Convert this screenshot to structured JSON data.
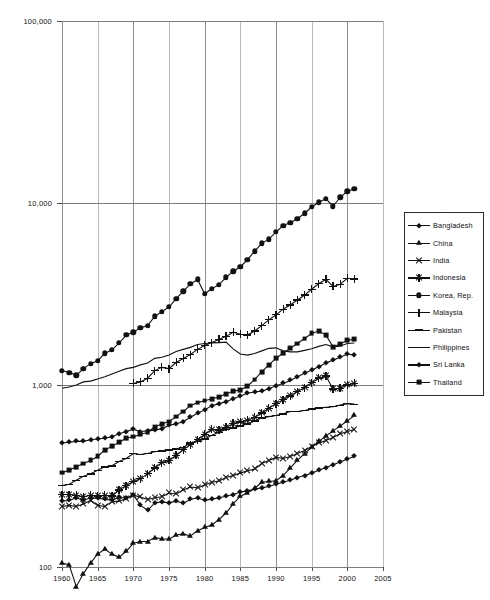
{
  "axes": {
    "ylabel": "1995 US Dollars (log scale)",
    "yticks": [
      "100,000",
      "10,000",
      "1,000",
      "100"
    ],
    "ytick_values": [
      100000,
      10000,
      1000,
      100
    ],
    "xticks": [
      "1960",
      "1965",
      "1970",
      "1975",
      "1980",
      "1985",
      "1990",
      "1995",
      "2000",
      "2005"
    ],
    "xtick_values": [
      1960,
      1965,
      1970,
      1975,
      1980,
      1985,
      1990,
      1995,
      2000,
      2005
    ]
  },
  "legend": {
    "position": "right",
    "items": [
      {
        "label": "Bangladesh",
        "marker": "diamond"
      },
      {
        "label": "China",
        "marker": "triangle"
      },
      {
        "label": "India",
        "marker": "cross"
      },
      {
        "label": "Indonesia",
        "marker": "star"
      },
      {
        "label": "Korea, Rep.",
        "marker": "circle"
      },
      {
        "label": "Malaysia",
        "marker": "plus"
      },
      {
        "label": "Pakistan",
        "marker": "dash"
      },
      {
        "label": "Philippines",
        "marker": "line"
      },
      {
        "label": "Sri Lanka",
        "marker": "diamond"
      },
      {
        "label": "Thailand",
        "marker": "square"
      }
    ]
  },
  "chart_data": {
    "type": "line",
    "title": "",
    "xlabel": "",
    "ylabel": "1995 US Dollars (log scale)",
    "yscale": "log",
    "ylim": [
      100,
      100000
    ],
    "xlim": [
      1960,
      2005
    ],
    "grid": true,
    "legend_position": "right",
    "x": [
      1960,
      1961,
      1962,
      1963,
      1964,
      1965,
      1966,
      1967,
      1968,
      1969,
      1970,
      1971,
      1972,
      1973,
      1974,
      1975,
      1976,
      1977,
      1978,
      1979,
      1980,
      1981,
      1982,
      1983,
      1984,
      1985,
      1986,
      1987,
      1988,
      1989,
      1990,
      1991,
      1992,
      1993,
      1994,
      1995,
      1996,
      1997,
      1998,
      1999,
      2000,
      2001
    ],
    "series": [
      {
        "name": "Korea, Rep.",
        "marker": "circle",
        "values": [
          1200,
          1170,
          1130,
          1230,
          1310,
          1360,
          1490,
          1560,
          1700,
          1880,
          1950,
          2060,
          2120,
          2380,
          2530,
          2680,
          2980,
          3270,
          3590,
          3800,
          3170,
          3380,
          3560,
          3900,
          4220,
          4450,
          4890,
          5420,
          6000,
          6330,
          6920,
          7520,
          7790,
          8190,
          8780,
          9500,
          10100,
          10550,
          9600,
          10750,
          11600,
          11950
        ]
      },
      {
        "name": "Malaysia",
        "marker": "plus",
        "values": [
          null,
          null,
          null,
          null,
          null,
          null,
          null,
          null,
          null,
          null,
          1020,
          1040,
          1090,
          1200,
          1250,
          1230,
          1330,
          1400,
          1470,
          1570,
          1650,
          1710,
          1780,
          1850,
          1950,
          1900,
          1880,
          1980,
          2120,
          2280,
          2430,
          2610,
          2750,
          2930,
          3120,
          3360,
          3610,
          3800,
          3480,
          3580,
          3860,
          3820
        ]
      },
      {
        "name": "Philippines",
        "marker": "line",
        "values": [
          960,
          975,
          1000,
          1040,
          1050,
          1080,
          1110,
          1150,
          1190,
          1230,
          1250,
          1290,
          1320,
          1400,
          1420,
          1460,
          1530,
          1570,
          1610,
          1670,
          1690,
          1700,
          1710,
          1720,
          1580,
          1480,
          1460,
          1490,
          1540,
          1590,
          1600,
          1540,
          1520,
          1520,
          1550,
          1580,
          1630,
          1670,
          1620,
          1640,
          1690,
          1700
        ]
      },
      {
        "name": "Thailand",
        "marker": "square",
        "values": [
          330,
          340,
          355,
          370,
          385,
          405,
          440,
          460,
          485,
          510,
          520,
          535,
          550,
          590,
          610,
          630,
          670,
          715,
          770,
          800,
          820,
          840,
          860,
          895,
          925,
          940,
          985,
          1070,
          1180,
          1290,
          1400,
          1500,
          1590,
          1690,
          1800,
          1920,
          1980,
          1880,
          1620,
          1680,
          1760,
          1780
        ]
      },
      {
        "name": "Sri Lanka",
        "marker": "diamond",
        "values": [
          480,
          485,
          490,
          490,
          500,
          505,
          510,
          520,
          540,
          555,
          570,
          555,
          560,
          565,
          575,
          600,
          610,
          630,
          665,
          700,
          730,
          770,
          790,
          810,
          840,
          870,
          900,
          915,
          925,
          955,
          990,
          1020,
          1060,
          1110,
          1160,
          1210,
          1260,
          1320,
          1370,
          1420,
          1480,
          1460
        ]
      },
      {
        "name": "Indonesia",
        "marker": "star",
        "values": [
          250,
          250,
          248,
          243,
          248,
          245,
          248,
          245,
          265,
          280,
          295,
          305,
          325,
          350,
          375,
          385,
          410,
          440,
          470,
          500,
          535,
          570,
          565,
          585,
          615,
          625,
          640,
          665,
          700,
          745,
          790,
          830,
          870,
          920,
          965,
          1030,
          1090,
          1120,
          950,
          960,
          1000,
          1020
        ]
      },
      {
        "name": "Pakistan",
        "marker": "dash",
        "values": [
          280,
          285,
          300,
          315,
          325,
          340,
          355,
          360,
          380,
          395,
          420,
          415,
          420,
          430,
          435,
          440,
          445,
          455,
          480,
          490,
          505,
          530,
          550,
          570,
          580,
          595,
          610,
          635,
          660,
          670,
          680,
          695,
          715,
          715,
          725,
          740,
          750,
          755,
          760,
          775,
          790,
          785
        ]
      },
      {
        "name": "India",
        "marker": "cross",
        "values": [
          215,
          218,
          215,
          222,
          232,
          218,
          215,
          228,
          230,
          237,
          248,
          242,
          235,
          240,
          243,
          255,
          252,
          265,
          275,
          272,
          282,
          292,
          297,
          310,
          318,
          328,
          338,
          345,
          370,
          385,
          400,
          395,
          405,
          420,
          437,
          460,
          480,
          495,
          515,
          540,
          555,
          570
        ]
      },
      {
        "name": "Bangladesh",
        "marker": "diamond",
        "values": [
          230,
          232,
          240,
          232,
          240,
          238,
          236,
          232,
          242,
          238,
          250,
          218,
          205,
          225,
          228,
          225,
          230,
          224,
          235,
          240,
          232,
          236,
          240,
          245,
          250,
          258,
          262,
          268,
          272,
          277,
          285,
          292,
          300,
          310,
          318,
          328,
          340,
          352,
          365,
          378,
          392,
          405
        ]
      },
      {
        "name": "China",
        "marker": "triangle",
        "values": [
          105,
          103,
          78,
          92,
          105,
          118,
          125,
          118,
          113,
          122,
          135,
          138,
          138,
          145,
          143,
          142,
          150,
          152,
          148,
          158,
          165,
          170,
          182,
          198,
          222,
          245,
          255,
          270,
          292,
          295,
          298,
          318,
          350,
          385,
          420,
          455,
          490,
          525,
          560,
          595,
          635,
          680
        ]
      }
    ]
  }
}
